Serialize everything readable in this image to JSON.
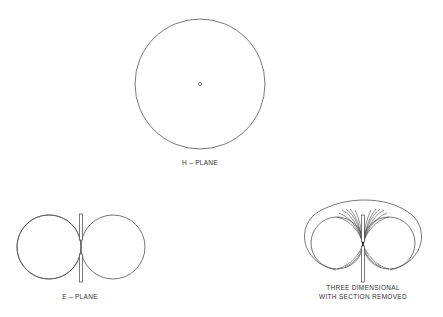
{
  "diagram": {
    "h_plane": {
      "label": "H – PLANE"
    },
    "e_plane": {
      "label": "E – PLANE"
    },
    "three_d": {
      "label_line1": "THREE DIMENSIONAL",
      "label_line2": "WITH SECTION REMOVED"
    }
  },
  "colors": {
    "line": "#555555",
    "background": "#ffffff"
  }
}
